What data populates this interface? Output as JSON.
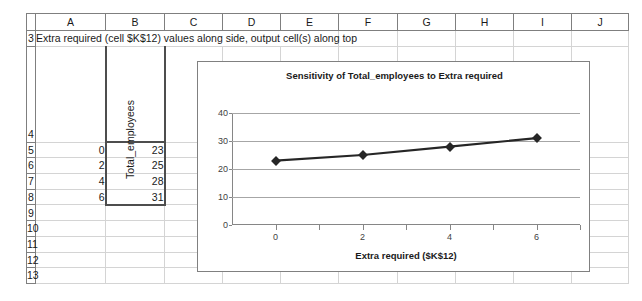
{
  "spreadsheet": {
    "columns": [
      "A",
      "B",
      "C",
      "D",
      "E",
      "F",
      "G",
      "H",
      "I",
      "J"
    ],
    "rows": [
      "3",
      "4",
      "5",
      "6",
      "7",
      "8",
      "9",
      "10",
      "11",
      "12",
      "13"
    ],
    "note_row3": "Extra required (cell $K$12) values along side, output cell(s) along top",
    "header_b4": "Total_employees",
    "data": [
      {
        "row": "5",
        "a": "0",
        "b": "23"
      },
      {
        "row": "6",
        "a": "2",
        "b": "25"
      },
      {
        "row": "7",
        "a": "4",
        "b": "28"
      },
      {
        "row": "8",
        "a": "6",
        "b": "31"
      }
    ]
  },
  "chart_data": {
    "type": "line",
    "title": "Sensitivity of Total_employees to Extra required",
    "xlabel": "Extra required ($K$12)",
    "ylabel": "",
    "x": [
      0,
      2,
      4,
      6
    ],
    "series": [
      {
        "name": "Total_employees",
        "values": [
          23,
          25,
          28,
          31
        ]
      }
    ],
    "xticks": [
      "0",
      "2",
      "4",
      "6"
    ],
    "yticks": [
      "0",
      "10",
      "20",
      "30",
      "40"
    ],
    "xlim": [
      -1,
      7
    ],
    "ylim": [
      0,
      40
    ],
    "grid": true,
    "legend": "none",
    "marker": "diamond",
    "line_color": "#262626"
  }
}
